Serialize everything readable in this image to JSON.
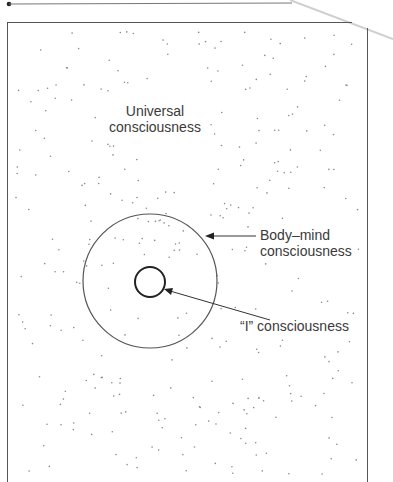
{
  "diagram": {
    "labels": {
      "universal": [
        "Universal",
        "consciousness"
      ],
      "body_mind": [
        "Body–mind",
        "consciousness"
      ],
      "i": "“I” consciousness"
    },
    "colors": {
      "ink": "#3a3a3a",
      "border": "#555555",
      "dots": "#8a8a8a",
      "edge": "#c8c8c8"
    },
    "nodes": [
      {
        "id": "universal",
        "type": "field"
      },
      {
        "id": "body_mind",
        "type": "circle",
        "cx": 150,
        "cy": 281,
        "r": 67
      },
      {
        "id": "i",
        "type": "circle",
        "cx": 150,
        "cy": 282,
        "r": 15
      }
    ],
    "edges": [
      {
        "from": "body_mind_label",
        "to": "body_mind",
        "type": "arrow"
      },
      {
        "from": "i_label",
        "to": "i",
        "type": "arrow"
      }
    ]
  }
}
